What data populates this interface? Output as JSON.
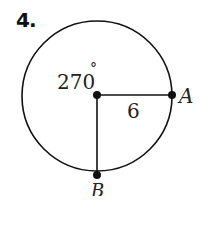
{
  "problem_number": "4.",
  "diagram": {
    "angle_label": "270",
    "degree_symbol": "°",
    "radius_label": "6",
    "point_a": "A",
    "point_b": "B"
  },
  "colors": {
    "stroke": "#111111",
    "background": "#ffffff"
  }
}
